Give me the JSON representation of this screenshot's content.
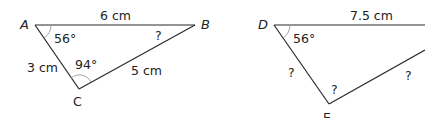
{
  "figure": {
    "triangle_abc": {
      "vertices": {
        "A": "A",
        "B": "B",
        "C": "C"
      },
      "sides": {
        "AB": "6 cm",
        "AC": "3 cm",
        "BC": "5 cm"
      },
      "angles": {
        "A": "56°",
        "C": "94°",
        "B": "?"
      }
    },
    "triangle_def": {
      "vertices": {
        "D": "D",
        "E": "E"
      },
      "sides": {
        "DF": "7.5 cm",
        "DE": "?",
        "EF": "?"
      },
      "angles": {
        "D": "56°",
        "E": "?"
      }
    }
  }
}
